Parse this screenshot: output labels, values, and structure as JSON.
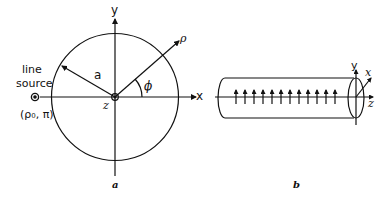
{
  "figure_a": {
    "caption": "a",
    "axis_x_label": "x",
    "axis_y_label": "y",
    "axis_z_label": "z",
    "radius_label": "a",
    "angle_label": "ϕ",
    "radial_label": "ρ",
    "source_label_line1": "line",
    "source_label_line2": "source",
    "source_coords": "(ρ₀, π)"
  },
  "figure_b": {
    "caption": "b",
    "axis_x_label": "x",
    "axis_y_label": "y",
    "axis_z_label": "z",
    "arrow_count": 12
  },
  "colors": {
    "ink": "#111111",
    "background": "#ffffff"
  }
}
